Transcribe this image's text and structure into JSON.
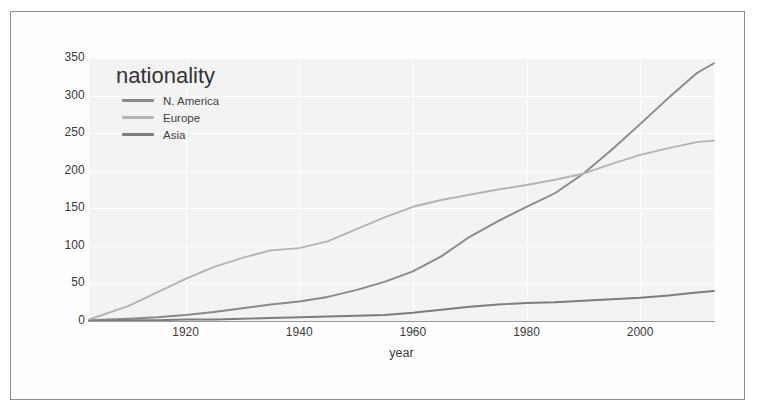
{
  "figure": {
    "background_color": "#f3f3f3",
    "border_color": "#8d8d8d"
  },
  "legend": {
    "title": "nationality",
    "position": "upper-left-inside",
    "entries": [
      {
        "label": "N. America",
        "color": "#8a8a8a"
      },
      {
        "label": "Europe",
        "color": "#b4b4b4"
      },
      {
        "label": "Asia",
        "color": "#7d7d7d"
      }
    ]
  },
  "axes": {
    "x_label": "year",
    "y_label": "",
    "x_ticks": [
      "1920",
      "1940",
      "1960",
      "1980",
      "2000"
    ],
    "y_ticks": [
      "0",
      "50",
      "100",
      "150",
      "200",
      "250",
      "300",
      "350"
    ]
  },
  "chart_data": {
    "type": "line",
    "title": "",
    "xlabel": "year",
    "ylabel": "",
    "xlim": [
      1903,
      2013
    ],
    "ylim": [
      0,
      350
    ],
    "grid": true,
    "legend_title": "nationality",
    "legend_position": "upper left (inside axes)",
    "x_tick_values": [
      1920,
      1940,
      1960,
      1980,
      2000
    ],
    "y_tick_values": [
      0,
      50,
      100,
      150,
      200,
      250,
      300,
      350
    ],
    "x": [
      1903,
      1910,
      1915,
      1920,
      1925,
      1930,
      1935,
      1940,
      1945,
      1950,
      1955,
      1960,
      1965,
      1970,
      1975,
      1980,
      1985,
      1990,
      1995,
      2000,
      2005,
      2010,
      2013
    ],
    "series": [
      {
        "name": "N. America",
        "color": "#8a8a8a",
        "values": [
          1,
          3,
          5,
          8,
          12,
          17,
          22,
          26,
          32,
          41,
          52,
          66,
          86,
          112,
          133,
          152,
          170,
          196,
          228,
          262,
          297,
          330,
          343
        ]
      },
      {
        "name": "Europe",
        "color": "#b4b4b4",
        "values": [
          2,
          20,
          38,
          56,
          72,
          84,
          94,
          97,
          106,
          122,
          138,
          152,
          161,
          168,
          175,
          181,
          188,
          196,
          209,
          221,
          230,
          238,
          240
        ]
      },
      {
        "name": "Asia",
        "color": "#7d7d7d",
        "values": [
          0,
          1,
          1,
          2,
          2,
          3,
          4,
          5,
          6,
          7,
          8,
          11,
          15,
          19,
          22,
          24,
          25,
          27,
          29,
          31,
          34,
          38,
          40
        ]
      }
    ],
    "annotations": [
      {
        "text": "N. America overtakes Europe",
        "x": 1988,
        "y": 186
      }
    ]
  }
}
